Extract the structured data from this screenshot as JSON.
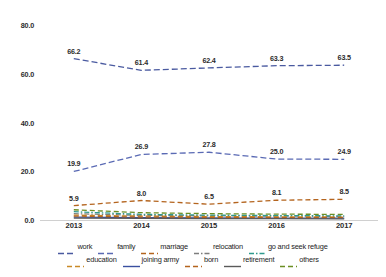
{
  "chart_data": {
    "type": "line",
    "title": "",
    "subtitle": "",
    "xlabel": "",
    "ylabel": "",
    "x": [
      "2013",
      "2014",
      "2015",
      "2016",
      "2017"
    ],
    "categories": [
      "2013",
      "2014",
      "2015",
      "2016",
      "2017"
    ],
    "ylim": [
      0.0,
      80.0
    ],
    "yticks": [
      "0.0",
      "20.0",
      "40.0",
      "60.0",
      "80.0"
    ],
    "ytick_values": [
      0.0,
      20.0,
      40.0,
      60.0,
      80.0
    ],
    "grid": false,
    "legend_position": "bottom",
    "series": [
      {
        "name": "work",
        "color": "#4a5aa0",
        "dash": "long-dash",
        "values": [
          66.2,
          61.4,
          62.4,
          63.3,
          63.5
        ],
        "labels": [
          "66.2",
          "61.4",
          "62.4",
          "63.3",
          "63.5"
        ],
        "labels_shown": true
      },
      {
        "name": "family",
        "color": "#5a6ab4",
        "dash": "long-dash",
        "values": [
          19.9,
          26.9,
          27.8,
          25.0,
          24.9
        ],
        "labels": [
          "19.9",
          "26.9",
          "27.8",
          "25.0",
          "24.9"
        ],
        "labels_shown": true
      },
      {
        "name": "marriage",
        "color": "#b4641e",
        "dash": "dash",
        "values": [
          5.9,
          8.0,
          6.5,
          8.1,
          8.5
        ],
        "labels": [
          "5.9",
          "8.0",
          "6.5",
          "8.1",
          "8.5"
        ],
        "labels_shown": true
      },
      {
        "name": "relocation",
        "color": "#7d7d7d",
        "dash": "dash-dot",
        "values": [
          2.6,
          1.9,
          1.7,
          1.6,
          1.5
        ],
        "labels": [],
        "labels_shown": false
      },
      {
        "name": "go and seek refuge",
        "color": "#2e9a8e",
        "dash": "dash-dot",
        "values": [
          3.4,
          2.3,
          2.0,
          1.8,
          1.7
        ],
        "labels": [],
        "labels_shown": false
      },
      {
        "name": "education",
        "color": "#c98a28",
        "dash": "dash",
        "values": [
          2.0,
          1.6,
          1.4,
          1.3,
          1.2
        ],
        "labels": [],
        "labels_shown": false
      },
      {
        "name": "joining army",
        "color": "#3a4fa0",
        "dash": "solid",
        "values": [
          1.2,
          1.0,
          0.9,
          0.8,
          0.8
        ],
        "labels": [],
        "labels_shown": false
      },
      {
        "name": "born",
        "color": "#b4641e",
        "dash": "dash",
        "values": [
          1.6,
          1.2,
          1.1,
          1.0,
          1.0
        ],
        "labels": [],
        "labels_shown": false
      },
      {
        "name": "retirement",
        "color": "#5a5a5a",
        "dash": "solid",
        "values": [
          0.8,
          0.7,
          0.6,
          0.6,
          0.5
        ],
        "labels": [],
        "labels_shown": false
      },
      {
        "name": "others",
        "color": "#6b8e23",
        "dash": "dash",
        "values": [
          4.2,
          3.0,
          2.6,
          2.4,
          2.3
        ],
        "labels": [],
        "labels_shown": false
      }
    ]
  },
  "legend": {
    "rows": [
      [
        "work",
        "family",
        "marriage",
        "relocation",
        "go and seek refuge"
      ],
      [
        "education",
        "joining army",
        "born",
        "retirement",
        "others"
      ]
    ]
  }
}
